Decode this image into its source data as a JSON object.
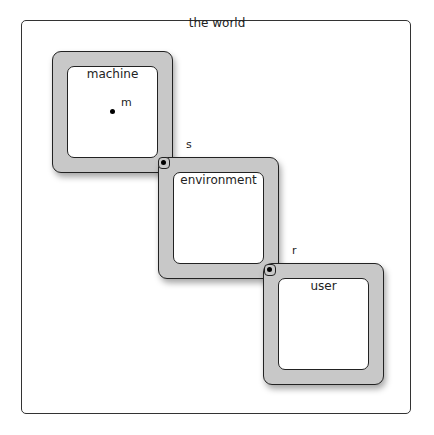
{
  "world": {
    "title": "the world"
  },
  "domains": [
    {
      "label": "machine"
    },
    {
      "label": "environment"
    },
    {
      "label": "user"
    }
  ],
  "phenomena": {
    "m": "m",
    "s": "s",
    "r": "r"
  }
}
